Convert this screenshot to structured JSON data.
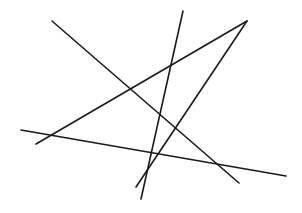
{
  "canvas": {
    "width": 302,
    "height": 213,
    "background": "#ffffff"
  },
  "style": {
    "stroke": "#1a1a1a",
    "stroke_width": 1.6
  },
  "lines": [
    {
      "id": "line-1",
      "x1": 52,
      "y1": 21,
      "x2": 239,
      "y2": 183
    },
    {
      "id": "line-2",
      "x1": 183,
      "y1": 11,
      "x2": 141,
      "y2": 199
    },
    {
      "id": "line-3",
      "x1": 247,
      "y1": 21,
      "x2": 36,
      "y2": 144
    },
    {
      "id": "line-4",
      "x1": 247,
      "y1": 21,
      "x2": 136,
      "y2": 187
    },
    {
      "id": "line-5",
      "x1": 21,
      "y1": 130,
      "x2": 286,
      "y2": 176
    }
  ]
}
